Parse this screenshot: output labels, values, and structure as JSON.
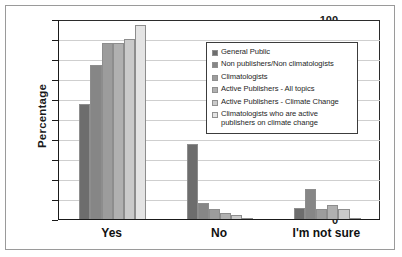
{
  "chart_data": {
    "type": "bar",
    "title": "",
    "xlabel": "",
    "ylabel": "Percentage",
    "ylim": [
      0,
      100
    ],
    "ytick_step": 10,
    "yticks": [
      0,
      10,
      20,
      30,
      40,
      50,
      60,
      70,
      80,
      90,
      100
    ],
    "grid": true,
    "legend_position": "inside-top-right",
    "categories": [
      "Yes",
      "No",
      "I'm not sure"
    ],
    "series": [
      {
        "name": "General Public",
        "color": "#6d6d6d",
        "values": [
          57.5,
          37.5,
          5.5
        ]
      },
      {
        "name": "Non publishers/Non climatologists",
        "color": "#868686",
        "values": [
          77,
          8,
          15
        ]
      },
      {
        "name": "Climatologists",
        "color": "#9c9c9c",
        "values": [
          88,
          5,
          5
        ]
      },
      {
        "name": "Active Publishers - All topics",
        "color": "#b0b0b0",
        "values": [
          88,
          3,
          7
        ]
      },
      {
        "name": "Active Publishers - Climate Change",
        "color": "#cacaca",
        "values": [
          90,
          2,
          5
        ]
      },
      {
        "name": "Climatologists who are active publishers on climate change",
        "color": "#e4e4e4",
        "values": [
          97,
          0.5,
          0.5
        ]
      }
    ]
  },
  "legend": {
    "entries": [
      "General Public",
      "Non publishers/Non climatologists",
      "Climatologists",
      "Active Publishers - All topics",
      "Active Publishers - Climate Change",
      "Climatologists who are active publishers on climate change"
    ]
  }
}
